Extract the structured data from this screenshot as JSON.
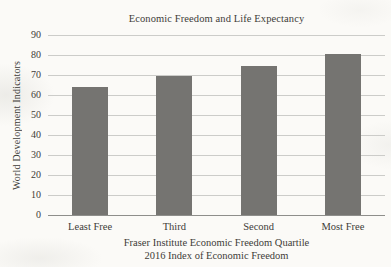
{
  "chart_data": {
    "type": "bar",
    "title": "Economic Freedom and Life Expectancy",
    "categories": [
      "Least Free",
      "Third",
      "Second",
      "Most Free"
    ],
    "values": [
      64,
      69.5,
      74.5,
      80.5
    ],
    "ylabel": "World Development Indicators",
    "xlabel_line1": "Fraser Institute Economic Freedom Quartile",
    "xlabel_line2": "2016 Index of Economic Freedom",
    "ylim": [
      0,
      90
    ],
    "yticks": [
      90,
      80,
      70,
      60,
      50,
      40,
      30,
      20,
      10,
      0
    ],
    "grid": true,
    "legend": false,
    "colors": {
      "bar": "#757471",
      "gridline": "#ccccc9",
      "axis_line": "#8e8e8b",
      "text": "#3e3c38",
      "background": "#fbfaf7"
    }
  }
}
